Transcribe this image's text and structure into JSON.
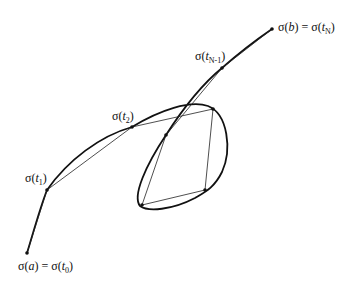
{
  "figure": {
    "colors": {
      "curve": "#111111",
      "chord": "#222222",
      "background": "#ffffff"
    }
  },
  "labels": {
    "start": {
      "sigma": "σ(",
      "arg": "a",
      "eq": ") = σ(",
      "t": "t",
      "sub": "0",
      "close": ")"
    },
    "t1": {
      "sigma": "σ(",
      "t": "t",
      "sub": "1",
      "close": ")"
    },
    "t2": {
      "sigma": "σ(",
      "t": "t",
      "sub": "2",
      "close": ")"
    },
    "tn1": {
      "sigma": "σ(",
      "t": "t",
      "sub": "N-1",
      "close": ")"
    },
    "end": {
      "sigma": "σ(",
      "arg": "b",
      "eq": ") = σ(",
      "t": "t",
      "sub": "N",
      "close": ")"
    }
  },
  "points": [
    {
      "name": "sigma-a",
      "x": 27,
      "y": 253
    },
    {
      "name": "sigma-t1",
      "x": 47,
      "y": 190
    },
    {
      "name": "sigma-t2",
      "x": 132,
      "y": 127
    },
    {
      "name": "loop-top-right",
      "x": 213,
      "y": 109
    },
    {
      "name": "loop-bottom-right",
      "x": 205,
      "y": 190
    },
    {
      "name": "loop-bottom-left",
      "x": 142,
      "y": 205
    },
    {
      "name": "loop-inner",
      "x": 166,
      "y": 135
    },
    {
      "name": "sigma-tN-1",
      "x": 222,
      "y": 68
    },
    {
      "name": "sigma-b",
      "x": 272,
      "y": 29
    }
  ]
}
